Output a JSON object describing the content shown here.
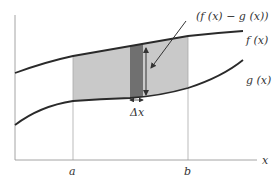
{
  "diagram": {
    "labels": {
      "difference": "(f (x) − g (x))",
      "f_curve": "f (x)",
      "g_curve": "g (x)",
      "delta_x": "Δx",
      "a": "a",
      "b": "b",
      "x_axis": "x"
    },
    "colors": {
      "region_fill": "#c8c8c8",
      "strip_fill": "#6e6e6e",
      "curve_stroke": "#2a2a2a",
      "axis_stroke": "#9a9a9a"
    }
  }
}
